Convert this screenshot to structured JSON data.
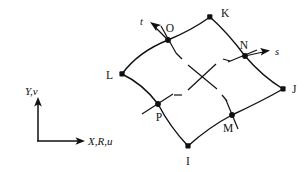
{
  "figure": {
    "type": "finite-element-quadrilateral-diagram",
    "background_color": "#ffffff",
    "line_color": "#111111"
  },
  "axes": {
    "vertical_label": "Y,v",
    "horizontal_label": "X,R,u",
    "origin": {
      "x": 38,
      "y": 140
    },
    "vertical_tip": {
      "x": 38,
      "y": 100
    },
    "horizontal_tip": {
      "x": 84,
      "y": 140
    }
  },
  "element": {
    "corner_nodes": [
      {
        "id": "K",
        "label": "K",
        "x": 210,
        "y": 17,
        "label_x": 221,
        "label_y": 13
      },
      {
        "id": "J",
        "label": "J",
        "x": 283,
        "y": 89,
        "label_x": 293,
        "label_y": 92
      },
      {
        "id": "I",
        "label": "I",
        "x": 188,
        "y": 146,
        "label_x": 188,
        "label_y": 162
      },
      {
        "id": "L",
        "label": "L",
        "x": 122,
        "y": 74,
        "label_x": 110,
        "label_y": 78
      }
    ],
    "mid_nodes": [
      {
        "id": "O",
        "label": "O",
        "x": 168,
        "y": 40,
        "label_x": 170,
        "label_y": 30
      },
      {
        "id": "N",
        "label": "N",
        "x": 245,
        "y": 56,
        "label_x": 244,
        "label_y": 48
      },
      {
        "id": "M",
        "label": "M",
        "x": 232,
        "y": 115,
        "label_x": 228,
        "label_y": 130
      },
      {
        "id": "P",
        "label": "P",
        "x": 158,
        "y": 104,
        "label_x": 158,
        "label_y": 119
      }
    ],
    "natural_coordinates": [
      {
        "id": "t",
        "label": "t",
        "origin_x": 168,
        "origin_y": 40,
        "tip_x": 152,
        "tip_y": 24,
        "label_x": 145,
        "label_y": 22
      },
      {
        "id": "s",
        "label": "s",
        "origin_x": 245,
        "origin_y": 56,
        "tip_x": 268,
        "tip_y": 52,
        "label_x": 275,
        "label_y": 54
      }
    ],
    "center_cross": {
      "x": 202,
      "y": 77,
      "arm": 15
    }
  }
}
